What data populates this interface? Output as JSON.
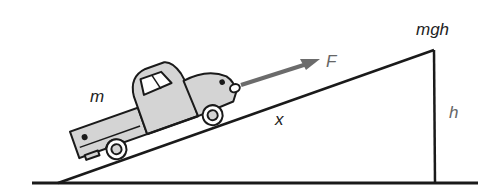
{
  "diagram": {
    "labels": {
      "mass": "m",
      "force": "F",
      "distance": "x",
      "height": "h",
      "potential_energy": "mgh"
    },
    "colors": {
      "line": "#1a1a1a",
      "truck_fill": "#d4d4d4",
      "arrow": "#6b6b6b",
      "background": "#ffffff"
    },
    "elements": [
      {
        "type": "ground",
        "description": "horizontal ground line"
      },
      {
        "type": "incline",
        "description": "ramp rising from left to right"
      },
      {
        "type": "vertical",
        "description": "vertical side of ramp, height h"
      },
      {
        "type": "truck",
        "description": "pickup truck of mass m on the incline"
      },
      {
        "type": "arrow",
        "description": "force F parallel to incline"
      }
    ]
  }
}
